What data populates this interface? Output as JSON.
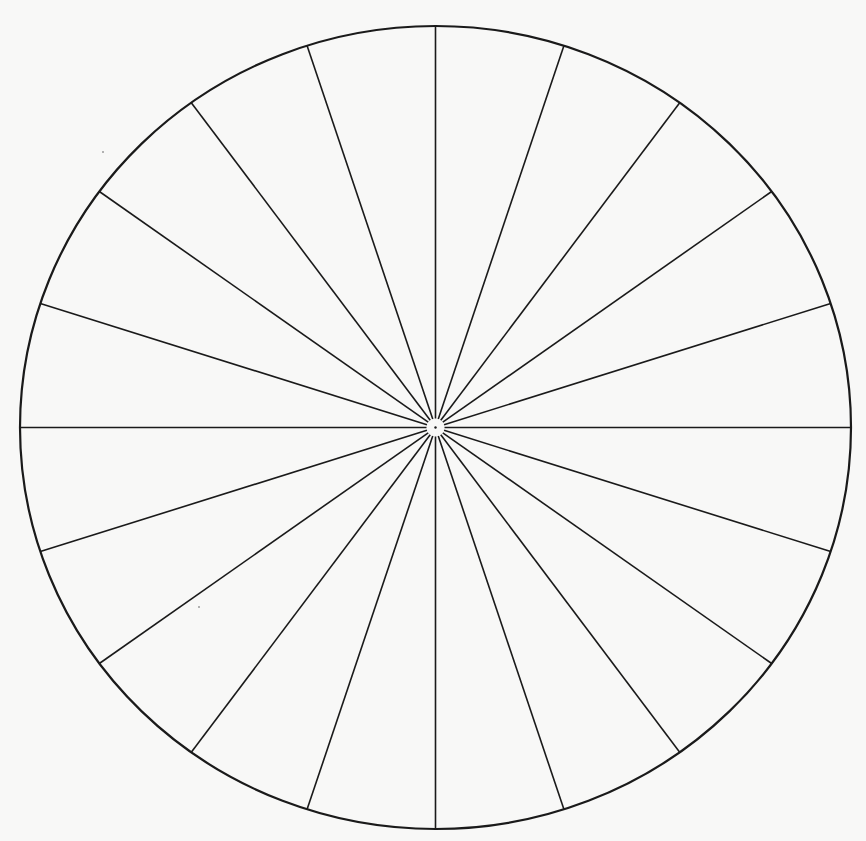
{
  "diagram": {
    "type": "radial-spoke-wheel",
    "background_color": "#f8f8f7",
    "stroke_color": "#1a1a1a",
    "canvas": {
      "width": 866,
      "height": 841
    },
    "center": {
      "x": 435.5,
      "y": 427.5
    },
    "radius_x": 415.5,
    "radius_y": 401.5,
    "rim_stroke_width": 2.2,
    "spoke_stroke_width": 1.6,
    "spoke_count": 20,
    "spoke_angle_step_deg": 18,
    "hub_gap_radius": 9,
    "center_dot_radius": 1.2
  }
}
